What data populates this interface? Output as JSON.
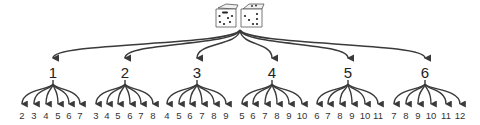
{
  "diagram": {
    "root": {
      "label": "two dice",
      "icon": "dice-pair-icon"
    },
    "colors": {
      "line": "#3a3a3a",
      "text": "#222222",
      "background": "#ffffff"
    },
    "levels": [
      {
        "label": "1",
        "x": 53,
        "children": [
          "2",
          "3",
          "4",
          "5",
          "6",
          "7"
        ],
        "child_x": [
          22,
          34,
          46,
          58,
          69,
          80
        ]
      },
      {
        "label": "2",
        "x": 125,
        "children": [
          "3",
          "4",
          "5",
          "6",
          "7",
          "8"
        ],
        "child_x": [
          96,
          107,
          118,
          130,
          141,
          153
        ]
      },
      {
        "label": "3",
        "x": 197,
        "children": [
          "4",
          "5",
          "6",
          "7",
          "8",
          "9"
        ],
        "child_x": [
          167,
          179,
          190,
          202,
          214,
          226
        ]
      },
      {
        "label": "4",
        "x": 272,
        "children": [
          "5",
          "6",
          "7",
          "8",
          "9",
          "10"
        ],
        "child_x": [
          242,
          253,
          265,
          277,
          289,
          302
        ]
      },
      {
        "label": "5",
        "x": 348,
        "children": [
          "6",
          "7",
          "8",
          "9",
          "10",
          "11"
        ],
        "child_x": [
          317,
          328,
          340,
          352,
          365,
          378
        ]
      },
      {
        "label": "6",
        "x": 425,
        "children": [
          "7",
          "8",
          "9",
          "10",
          "11",
          "12"
        ],
        "child_x": [
          394,
          406,
          418,
          431,
          446,
          460
        ]
      }
    ]
  }
}
